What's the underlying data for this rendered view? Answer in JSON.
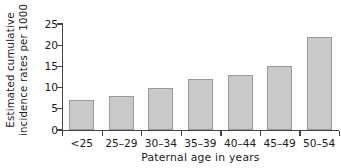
{
  "chart_data": {
    "type": "bar",
    "title": "",
    "subtitle": "",
    "xlabel": "Paternal age in years",
    "ylabel": "Estimated cumulative incidence rates per 1000",
    "ylabel_line1": "Estimated cumulative",
    "ylabel_line2": "incidence rates per 1000",
    "categories": [
      "<25",
      "25–29",
      "30–34",
      "35–39",
      "40–44",
      "45–49",
      "50–54"
    ],
    "values": [
      7,
      8,
      10,
      12,
      13,
      15,
      22
    ],
    "ylim": [
      0,
      25
    ],
    "yticks": [
      0,
      5,
      10,
      15,
      20,
      25
    ],
    "ytick_labels": [
      "0",
      "5",
      "10",
      "15",
      "20",
      "25"
    ],
    "grid": false,
    "legend": false,
    "legend_position": "none",
    "bar_fill_color": "#c9c9c9",
    "bar_edge_color": "#9a9a9a",
    "axis_color": "#444444",
    "background_color": "#ffffff"
  }
}
